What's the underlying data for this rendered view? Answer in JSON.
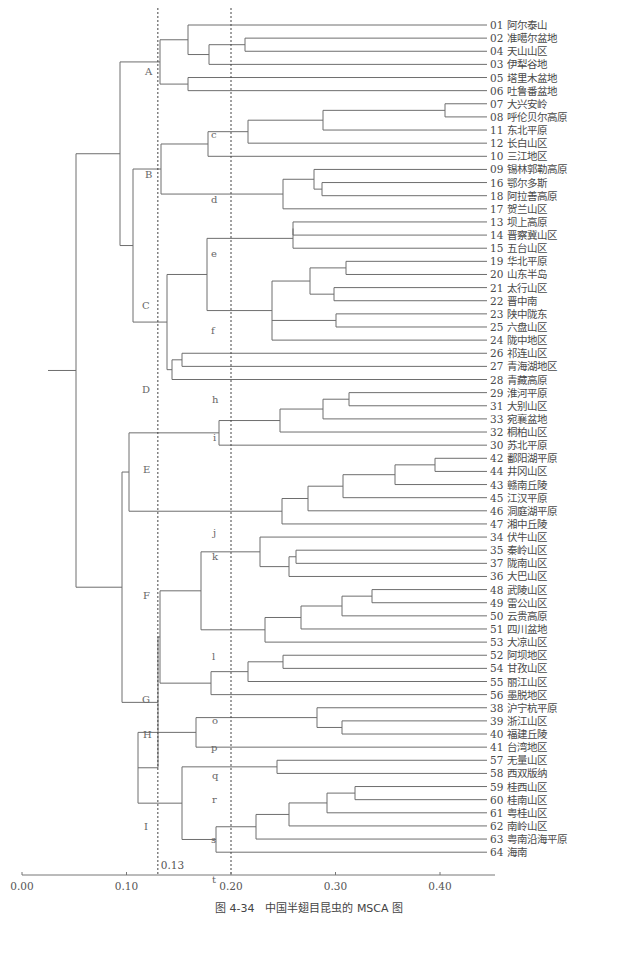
{
  "caption": "图 4-34　中国半翅目昆虫的 MSCA 图",
  "chart_data": {
    "type": "dendrogram",
    "xlabel": "",
    "axis": {
      "min": 0.0,
      "max": 0.45,
      "ticks": [
        "0.00",
        "0.10",
        "0.20",
        "0.30",
        "0.40"
      ],
      "tick_values": [
        0.0,
        0.1,
        0.2,
        0.3,
        0.4
      ]
    },
    "cut_lines": [
      {
        "value": 0.13,
        "label": "0.13"
      },
      {
        "value": 0.2,
        "label": ""
      }
    ],
    "leaves": [
      "01 阿尔泰山",
      "02 准噶尔盆地",
      "04 天山山区",
      "03 伊犁谷地",
      "05 塔里木盆地",
      "06 吐鲁番盆地",
      "07 大兴安岭",
      "08 呼伦贝尔高原",
      "11 东北平原",
      "12 长白山区",
      "10 三江地区",
      "09 锡林郭勒高原",
      "16 鄂尔多斯",
      "18 阿拉善高原",
      "17 贺兰山区",
      "13 坝上高原",
      "14 晋察冀山区",
      "15 五台山区",
      "19 华北平原",
      "20 山东半岛",
      "21 太行山区",
      "22 晋中南",
      "23 陕中陇东",
      "25 六盘山区",
      "24 陇中地区",
      "26 祁连山区",
      "27 青海湖地区",
      "28 青藏高原",
      "29 淮河平原",
      "31 大别山区",
      "33 宛襄盆地",
      "32 桐柏山区",
      "30 苏北平原",
      "42 鄱阳湖平原",
      "44 井冈山区",
      "43 赣南丘陵",
      "45 江汉平原",
      "46 洞庭湖平原",
      "47 湘中丘陵",
      "34 伏牛山区",
      "35 秦岭山区",
      "37 陇南山区",
      "36 大巴山区",
      "48 武陵山区",
      "49 雷公山区",
      "50 云贵高原",
      "51 四川盆地",
      "53 大凉山区",
      "52 阿坝地区",
      "54 甘孜山区",
      "55 丽江山区",
      "56 墨脱地区",
      "38 沪宁杭平原",
      "39 浙江山区",
      "40 福建丘陵",
      "41 台湾地区",
      "57 无量山区",
      "58 西双版纳",
      "59 桂西山区",
      "60 桂南山区",
      "61 粤桂山区",
      "62 南岭山区",
      "63 粤南沿海平原",
      "64 海南"
    ],
    "major_groups": [
      "A",
      "B",
      "C",
      "D",
      "E",
      "F",
      "G",
      "H",
      "I"
    ],
    "minor_groups": [
      "c",
      "d",
      "e",
      "f",
      "h",
      "i",
      "j",
      "k",
      "l",
      "o",
      "p",
      "q",
      "r",
      "s",
      "t"
    ]
  },
  "layout": {
    "leaf_top": 25,
    "leaf_step": 13.13,
    "leaf_end_x": 487,
    "label_x": 490,
    "axis_y": 875,
    "axis_x0": 22,
    "px_per_unit": 1045
  },
  "group_labels": [
    {
      "t": "A",
      "x": 145,
      "y": 75
    },
    {
      "t": "B",
      "x": 145,
      "y": 178
    },
    {
      "t": "C",
      "x": 142,
      "y": 309
    },
    {
      "t": "D",
      "x": 142,
      "y": 393
    },
    {
      "t": "E",
      "x": 143,
      "y": 473
    },
    {
      "t": "F",
      "x": 143,
      "y": 599
    },
    {
      "t": "G",
      "x": 142,
      "y": 703
    },
    {
      "t": "H",
      "x": 143,
      "y": 738
    },
    {
      "t": "I",
      "x": 144,
      "y": 830
    },
    {
      "t": "c",
      "x": 211,
      "y": 138
    },
    {
      "t": "d",
      "x": 211,
      "y": 203
    },
    {
      "t": "e",
      "x": 211,
      "y": 257
    },
    {
      "t": "f",
      "x": 211,
      "y": 334
    },
    {
      "t": "h",
      "x": 212,
      "y": 403
    },
    {
      "t": "i",
      "x": 213,
      "y": 441
    },
    {
      "t": "j",
      "x": 213,
      "y": 536
    },
    {
      "t": "k",
      "x": 212,
      "y": 560
    },
    {
      "t": "l",
      "x": 212,
      "y": 660
    },
    {
      "t": "o",
      "x": 212,
      "y": 724
    },
    {
      "t": "p",
      "x": 211,
      "y": 751
    },
    {
      "t": "q",
      "x": 212,
      "y": 779
    },
    {
      "t": "r",
      "x": 212,
      "y": 803
    },
    {
      "t": "s",
      "x": 211,
      "y": 843
    },
    {
      "t": "t",
      "x": 212,
      "y": 883
    }
  ]
}
